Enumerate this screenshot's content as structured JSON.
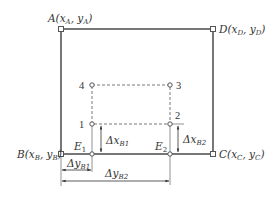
{
  "diagram": {
    "corners": {
      "A": {
        "label": "A(x",
        "sub1": "A",
        "mid": ", y",
        "sub2": "A",
        "end": ")"
      },
      "B": {
        "label": "B(x",
        "sub1": "B",
        "mid": ", y",
        "sub2": "B",
        "end": ")"
      },
      "C": {
        "label": "C(x",
        "sub1": "C",
        "mid": ", y",
        "sub2": "C",
        "end": ")"
      },
      "D": {
        "label": "D(x",
        "sub1": "D",
        "mid": ", y",
        "sub2": "D",
        "end": ")"
      }
    },
    "points": {
      "p1": "1",
      "p2": "2",
      "p3": "3",
      "p4": "4"
    },
    "feet": {
      "E1": {
        "main": "E",
        "sub": "1"
      },
      "E2": {
        "main": "E",
        "sub": "2"
      }
    },
    "dimensions": {
      "dxB1": {
        "main": "Δx",
        "sub": "B1"
      },
      "dxB2": {
        "main": "Δx",
        "sub": "B2"
      },
      "dyB1": {
        "main": "Δy",
        "sub": "B1"
      },
      "dyB2": {
        "main": "Δy",
        "sub": "B2"
      }
    },
    "colors": {
      "stroke": "#555555",
      "text": "#333333"
    }
  }
}
